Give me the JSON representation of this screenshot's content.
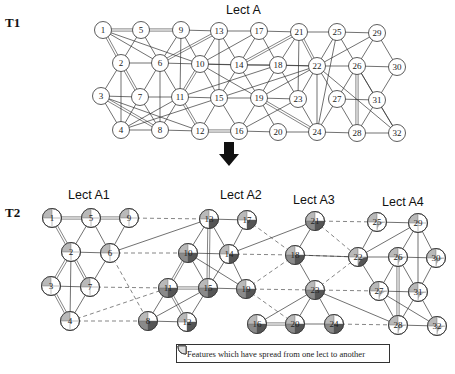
{
  "stages": [
    {
      "id": "T1",
      "label": "T1"
    },
    {
      "id": "T2",
      "label": "T2"
    }
  ],
  "t1": {
    "title": "Lect A",
    "nodes": [
      {
        "id": "1",
        "x": 103,
        "y": 30
      },
      {
        "id": "5",
        "x": 141,
        "y": 30
      },
      {
        "id": "9",
        "x": 181,
        "y": 30
      },
      {
        "id": "13",
        "x": 219,
        "y": 31
      },
      {
        "id": "17",
        "x": 259,
        "y": 31
      },
      {
        "id": "21",
        "x": 299,
        "y": 32
      },
      {
        "id": "25",
        "x": 337,
        "y": 32
      },
      {
        "id": "29",
        "x": 377,
        "y": 33
      },
      {
        "id": "2",
        "x": 121,
        "y": 63
      },
      {
        "id": "6",
        "x": 160,
        "y": 63
      },
      {
        "id": "10",
        "x": 200,
        "y": 64
      },
      {
        "id": "14",
        "x": 239,
        "y": 65
      },
      {
        "id": "18",
        "x": 278,
        "y": 65
      },
      {
        "id": "22",
        "x": 317,
        "y": 66
      },
      {
        "id": "26",
        "x": 357,
        "y": 66
      },
      {
        "id": "30",
        "x": 397,
        "y": 67
      },
      {
        "id": "3",
        "x": 101,
        "y": 96
      },
      {
        "id": "7",
        "x": 140,
        "y": 97
      },
      {
        "id": "11",
        "x": 180,
        "y": 97
      },
      {
        "id": "15",
        "x": 219,
        "y": 98
      },
      {
        "id": "19",
        "x": 259,
        "y": 98
      },
      {
        "id": "23",
        "x": 298,
        "y": 99
      },
      {
        "id": "27",
        "x": 337,
        "y": 99
      },
      {
        "id": "31",
        "x": 377,
        "y": 100
      },
      {
        "id": "4",
        "x": 121,
        "y": 130
      },
      {
        "id": "8",
        "x": 160,
        "y": 130
      },
      {
        "id": "12",
        "x": 200,
        "y": 131
      },
      {
        "id": "16",
        "x": 239,
        "y": 131
      },
      {
        "id": "20",
        "x": 278,
        "y": 132
      },
      {
        "id": "24",
        "x": 317,
        "y": 132
      },
      {
        "id": "28",
        "x": 357,
        "y": 133
      },
      {
        "id": "32",
        "x": 397,
        "y": 133
      }
    ],
    "edges": [
      [
        "1",
        "5",
        "d"
      ],
      [
        "5",
        "9",
        "d"
      ],
      [
        "9",
        "13"
      ],
      [
        "13",
        "17"
      ],
      [
        "17",
        "21"
      ],
      [
        "21",
        "25"
      ],
      [
        "25",
        "29"
      ],
      [
        "1",
        "2",
        "d"
      ],
      [
        "1",
        "6"
      ],
      [
        "1",
        "10"
      ],
      [
        "5",
        "2"
      ],
      [
        "5",
        "6"
      ],
      [
        "9",
        "6"
      ],
      [
        "9",
        "10"
      ],
      [
        "9",
        "11"
      ],
      [
        "13",
        "10"
      ],
      [
        "13",
        "6",
        "d"
      ],
      [
        "13",
        "14"
      ],
      [
        "13",
        "15"
      ],
      [
        "17",
        "14"
      ],
      [
        "17",
        "18"
      ],
      [
        "17",
        "10"
      ],
      [
        "21",
        "14",
        "d"
      ],
      [
        "21",
        "18"
      ],
      [
        "21",
        "22",
        "d"
      ],
      [
        "21",
        "23"
      ],
      [
        "25",
        "22"
      ],
      [
        "25",
        "26"
      ],
      [
        "25",
        "24"
      ],
      [
        "29",
        "26"
      ],
      [
        "29",
        "30"
      ],
      [
        "29",
        "22"
      ],
      [
        "2",
        "6"
      ],
      [
        "6",
        "10"
      ],
      [
        "10",
        "14"
      ],
      [
        "14",
        "18"
      ],
      [
        "18",
        "22"
      ],
      [
        "22",
        "26"
      ],
      [
        "26",
        "30"
      ],
      [
        "2",
        "3"
      ],
      [
        "2",
        "7",
        "d"
      ],
      [
        "2",
        "4"
      ],
      [
        "6",
        "7"
      ],
      [
        "6",
        "11"
      ],
      [
        "6",
        "8"
      ],
      [
        "10",
        "11",
        "d"
      ],
      [
        "10",
        "15"
      ],
      [
        "10",
        "19"
      ],
      [
        "10",
        "22"
      ],
      [
        "14",
        "15"
      ],
      [
        "14",
        "19"
      ],
      [
        "18",
        "19"
      ],
      [
        "18",
        "23"
      ],
      [
        "18",
        "11"
      ],
      [
        "22",
        "23"
      ],
      [
        "22",
        "19"
      ],
      [
        "22",
        "27"
      ],
      [
        "22",
        "15"
      ],
      [
        "22",
        "24"
      ],
      [
        "26",
        "27"
      ],
      [
        "26",
        "31"
      ],
      [
        "26",
        "28",
        "d"
      ],
      [
        "30",
        "31"
      ],
      [
        "22",
        "32"
      ],
      [
        "3",
        "7"
      ],
      [
        "7",
        "11"
      ],
      [
        "11",
        "15"
      ],
      [
        "15",
        "19"
      ],
      [
        "19",
        "23"
      ],
      [
        "27",
        "31"
      ],
      [
        "3",
        "4"
      ],
      [
        "3",
        "8",
        "d"
      ],
      [
        "3",
        "12"
      ],
      [
        "7",
        "4"
      ],
      [
        "7",
        "8"
      ],
      [
        "11",
        "4"
      ],
      [
        "11",
        "8"
      ],
      [
        "11",
        "12",
        "d"
      ],
      [
        "15",
        "12"
      ],
      [
        "15",
        "16"
      ],
      [
        "15",
        "4"
      ],
      [
        "19",
        "16"
      ],
      [
        "19",
        "20"
      ],
      [
        "19",
        "24",
        "d"
      ],
      [
        "23",
        "24"
      ],
      [
        "23",
        "16"
      ],
      [
        "27",
        "24"
      ],
      [
        "27",
        "28"
      ],
      [
        "31",
        "28"
      ],
      [
        "31",
        "32"
      ],
      [
        "26",
        "32"
      ],
      [
        "4",
        "8"
      ],
      [
        "8",
        "12"
      ],
      [
        "12",
        "16",
        "d"
      ],
      [
        "16",
        "20"
      ],
      [
        "20",
        "24"
      ],
      [
        "24",
        "28"
      ],
      [
        "28",
        "32"
      ]
    ]
  },
  "t2": {
    "lects": [
      {
        "id": "A1",
        "title": "Lect A1",
        "x": 92,
        "y": 188
      },
      {
        "id": "A2",
        "title": "Lect A2",
        "x": 216,
        "y": 188
      },
      {
        "id": "A3",
        "title": "Lect A3",
        "x": 298,
        "y": 193
      },
      {
        "id": "A4",
        "title": "Lect A4",
        "x": 382,
        "y": 195
      }
    ],
    "nodes": [
      {
        "id": "1",
        "x": 52,
        "y": 218,
        "q": [
          1,
          0,
          0,
          0
        ]
      },
      {
        "id": "5",
        "x": 91,
        "y": 218,
        "q": [
          1,
          0,
          0,
          0
        ]
      },
      {
        "id": "9",
        "x": 129,
        "y": 218,
        "q": [
          1,
          0,
          0,
          0
        ]
      },
      {
        "id": "2",
        "x": 71,
        "y": 252,
        "q": [
          1,
          0,
          0,
          0
        ]
      },
      {
        "id": "6",
        "x": 110,
        "y": 253,
        "q": [
          1,
          0,
          0,
          0
        ]
      },
      {
        "id": "3",
        "x": 51,
        "y": 286,
        "q": [
          1,
          0,
          0,
          0
        ]
      },
      {
        "id": "7",
        "x": 90,
        "y": 287,
        "q": [
          1,
          0,
          0,
          0
        ]
      },
      {
        "id": "4",
        "x": 70,
        "y": 321,
        "q": [
          1,
          0,
          0,
          0
        ]
      },
      {
        "id": "13",
        "x": 209,
        "y": 219,
        "q": [
          1,
          1,
          0,
          0
        ]
      },
      {
        "id": "17",
        "x": 247,
        "y": 220,
        "q": [
          1,
          1,
          0,
          0
        ]
      },
      {
        "id": "10",
        "x": 188,
        "y": 253,
        "q": [
          1,
          1,
          1,
          0
        ]
      },
      {
        "id": "14",
        "x": 229,
        "y": 254,
        "q": [
          1,
          1,
          0,
          0
        ]
      },
      {
        "id": "11",
        "x": 168,
        "y": 288,
        "q": [
          1,
          1,
          1,
          0
        ]
      },
      {
        "id": "15",
        "x": 208,
        "y": 288,
        "q": [
          1,
          1,
          1,
          0
        ]
      },
      {
        "id": "19",
        "x": 246,
        "y": 289,
        "q": [
          1,
          1,
          1,
          0
        ]
      },
      {
        "id": "8",
        "x": 148,
        "y": 321,
        "q": [
          1,
          1,
          1,
          0
        ]
      },
      {
        "id": "12",
        "x": 187,
        "y": 322,
        "q": [
          1,
          1,
          0,
          0
        ]
      },
      {
        "id": "21",
        "x": 315,
        "y": 221,
        "q": [
          1,
          1,
          1,
          0
        ]
      },
      {
        "id": "18",
        "x": 295,
        "y": 255,
        "q": [
          1,
          1,
          1,
          0
        ]
      },
      {
        "id": "22",
        "x": 358,
        "y": 257,
        "q": [
          1,
          1,
          0,
          1
        ]
      },
      {
        "id": "23",
        "x": 315,
        "y": 290,
        "q": [
          1,
          1,
          1,
          0
        ]
      },
      {
        "id": "16",
        "x": 257,
        "y": 324,
        "q": [
          1,
          1,
          1,
          0
        ]
      },
      {
        "id": "20",
        "x": 295,
        "y": 324,
        "q": [
          1,
          1,
          1,
          0
        ]
      },
      {
        "id": "24",
        "x": 334,
        "y": 324,
        "q": [
          1,
          1,
          1,
          0
        ]
      },
      {
        "id": "25",
        "x": 377,
        "y": 222,
        "q": [
          1,
          0,
          0,
          1
        ]
      },
      {
        "id": "29",
        "x": 418,
        "y": 223,
        "q": [
          1,
          0,
          0,
          0
        ]
      },
      {
        "id": "26",
        "x": 398,
        "y": 257,
        "q": [
          1,
          0,
          0,
          1
        ]
      },
      {
        "id": "30",
        "x": 436,
        "y": 258,
        "q": [
          1,
          0,
          0,
          1
        ]
      },
      {
        "id": "27",
        "x": 379,
        "y": 291,
        "q": [
          1,
          0,
          0,
          1
        ]
      },
      {
        "id": "31",
        "x": 418,
        "y": 292,
        "q": [
          1,
          0,
          0,
          1
        ]
      },
      {
        "id": "28",
        "x": 398,
        "y": 325,
        "q": [
          1,
          0,
          0,
          1
        ]
      },
      {
        "id": "32",
        "x": 437,
        "y": 326,
        "q": [
          1,
          0,
          0,
          1
        ]
      }
    ],
    "edges": [
      [
        "1",
        "5",
        "d"
      ],
      [
        "5",
        "9",
        "d"
      ],
      [
        "1",
        "2",
        "d"
      ],
      [
        "5",
        "2"
      ],
      [
        "5",
        "6"
      ],
      [
        "9",
        "6"
      ],
      [
        "2",
        "6"
      ],
      [
        "2",
        "3",
        "d"
      ],
      [
        "2",
        "7",
        "d"
      ],
      [
        "2",
        "4"
      ],
      [
        "6",
        "7"
      ],
      [
        "3",
        "7"
      ],
      [
        "3",
        "4",
        "d"
      ],
      [
        "7",
        "4"
      ],
      [
        "6",
        "13"
      ],
      [
        "13",
        "17"
      ],
      [
        "13",
        "10"
      ],
      [
        "13",
        "14"
      ],
      [
        "13",
        "15",
        "d"
      ],
      [
        "17",
        "14"
      ],
      [
        "10",
        "14"
      ],
      [
        "10",
        "11",
        "d"
      ],
      [
        "10",
        "15"
      ],
      [
        "10",
        "19"
      ],
      [
        "14",
        "15"
      ],
      [
        "14",
        "19"
      ],
      [
        "11",
        "15",
        "d"
      ],
      [
        "15",
        "19"
      ],
      [
        "11",
        "8"
      ],
      [
        "11",
        "12",
        "d"
      ],
      [
        "15",
        "8"
      ],
      [
        "15",
        "12"
      ],
      [
        "8",
        "12"
      ],
      [
        "14",
        "21"
      ],
      [
        "21",
        "18"
      ],
      [
        "18",
        "23"
      ],
      [
        "18",
        "22"
      ],
      [
        "23",
        "16"
      ],
      [
        "23",
        "20"
      ],
      [
        "23",
        "24"
      ],
      [
        "23",
        "28"
      ],
      [
        "16",
        "20",
        "d"
      ],
      [
        "20",
        "24"
      ],
      [
        "25",
        "29"
      ],
      [
        "25",
        "22"
      ],
      [
        "22",
        "29"
      ],
      [
        "22",
        "26"
      ],
      [
        "22",
        "27"
      ],
      [
        "26",
        "29"
      ],
      [
        "26",
        "30"
      ],
      [
        "26",
        "27"
      ],
      [
        "26",
        "31"
      ],
      [
        "26",
        "28",
        "d"
      ],
      [
        "29",
        "30"
      ],
      [
        "29",
        "31"
      ],
      [
        "30",
        "31"
      ],
      [
        "27",
        "31"
      ],
      [
        "27",
        "28"
      ],
      [
        "27",
        "32"
      ],
      [
        "31",
        "28"
      ],
      [
        "31",
        "32"
      ],
      [
        "28",
        "32"
      ]
    ],
    "dashed_edges": [
      [
        "9",
        "13"
      ],
      [
        "6",
        "10"
      ],
      [
        "7",
        "11"
      ],
      [
        "4",
        "8"
      ],
      [
        "4",
        "11"
      ],
      [
        "6",
        "8"
      ],
      [
        "17",
        "18"
      ],
      [
        "14",
        "18"
      ],
      [
        "19",
        "23"
      ],
      [
        "19",
        "20"
      ],
      [
        "19",
        "18"
      ],
      [
        "21",
        "25"
      ],
      [
        "21",
        "22"
      ],
      [
        "18",
        "22"
      ],
      [
        "23",
        "22"
      ],
      [
        "23",
        "27"
      ],
      [
        "24",
        "28"
      ]
    ]
  },
  "arrow": {
    "x": 229,
    "y": 152,
    "direction": "down"
  },
  "legend": {
    "text": "Features which have spread from one lect to another",
    "swatches": [
      {
        "name": "quarter-light",
        "fill": "#b9b9b9",
        "q": 0
      },
      {
        "name": "quarter-dark",
        "fill": "#555555",
        "q": 1
      },
      {
        "name": "quarter-outline",
        "fill": "#ffffff",
        "q": 2
      }
    ]
  },
  "colors": {
    "line": "#333333",
    "node_fill": "#ffffff",
    "shade_light": "#b9b9b9",
    "shade_dark": "#555555",
    "shade_mid": "#8a8a8a"
  }
}
